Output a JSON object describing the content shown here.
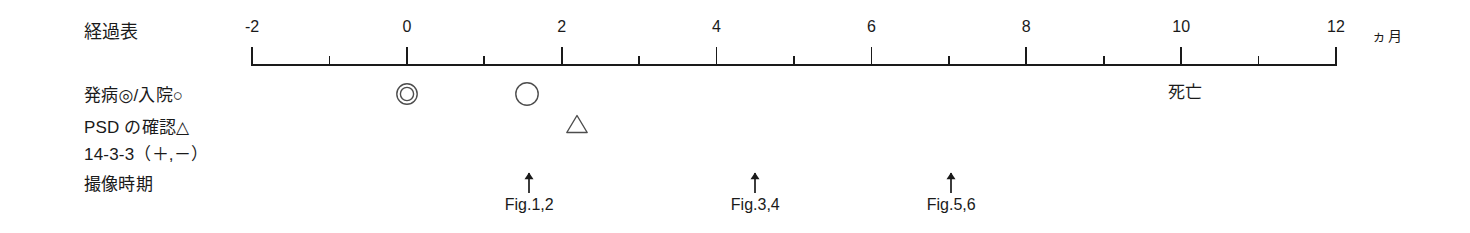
{
  "figure": {
    "title": "経過表",
    "background_color": "#ffffff",
    "ink_color": "#1a1a1a"
  },
  "axis": {
    "unit_label": "ヵ月",
    "min": -2,
    "max": 12,
    "tick_step": 1,
    "major_tick_step": 2,
    "labeled_ticks": [
      {
        "value": -2,
        "label": "-2"
      },
      {
        "value": 0,
        "label": "0"
      },
      {
        "value": 2,
        "label": "2"
      },
      {
        "value": 4,
        "label": "4"
      },
      {
        "value": 6,
        "label": "6"
      },
      {
        "value": 8,
        "label": "8"
      },
      {
        "value": 10,
        "label": "10"
      },
      {
        "value": 12,
        "label": "12"
      }
    ],
    "minor_ticks": [
      -1,
      1,
      3,
      5,
      7,
      9,
      11
    ]
  },
  "rows": [
    {
      "id": "onset-admission",
      "label": "発病◎/入院○"
    },
    {
      "id": "psd-confirmation",
      "label": "PSD の確認△"
    },
    {
      "id": "protein-14-3-3",
      "label": "14-3-3（＋,－）"
    },
    {
      "id": "imaging-timing",
      "label": "撮像時期"
    }
  ],
  "markers": {
    "onset": {
      "symbol": "double-circle",
      "symbol_text": "◎",
      "month": 0,
      "meaning": "発病"
    },
    "admission": {
      "symbol": "circle",
      "symbol_text": "○",
      "month": 1.55,
      "meaning": "入院"
    },
    "psd": {
      "symbol": "triangle",
      "symbol_text": "△",
      "month": 2.2,
      "meaning": "PSD の確認"
    },
    "death": {
      "text": "死亡",
      "month": 10.05
    }
  },
  "imaging": [
    {
      "caption": "Fig.1,2",
      "month": 1.58
    },
    {
      "caption": "Fig.3,4",
      "month": 4.5
    },
    {
      "caption": "Fig.5,6",
      "month": 7.03
    }
  ],
  "geometry": {
    "axis_left_px": 252,
    "axis_right_px": 1336,
    "axis_y_px": 64,
    "unit_x_px": 1372,
    "unit_y_px": 27,
    "label_x_px": 84,
    "row_y_px": [
      22,
      86,
      118,
      145,
      175
    ],
    "marker_row_y_px": 94,
    "psd_row_y_px": 124,
    "arrow_y_px": 172,
    "caption_y_px": 196
  }
}
